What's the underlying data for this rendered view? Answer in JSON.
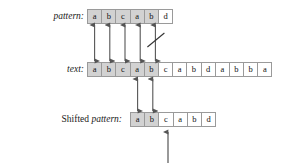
{
  "figure": {
    "background_color": "#ffffff",
    "cell_border_color": "#9a9a9a",
    "cell_shade_color": "#d2d2d2",
    "arrow_color": "#555555",
    "text_color": "#111111"
  },
  "rows": {
    "pattern": {
      "label_roman": "",
      "label_italic": "pattern:",
      "cells": [
        "a",
        "b",
        "c",
        "a",
        "b",
        "d"
      ],
      "shaded": [
        true,
        true,
        true,
        true,
        true,
        false
      ]
    },
    "text": {
      "label_roman": "",
      "label_italic": "text:",
      "cells": [
        "a",
        "b",
        "c",
        "a",
        "b",
        "c",
        "a",
        "b",
        "d",
        "a",
        "b",
        "b",
        "a"
      ],
      "shaded": [
        true,
        true,
        true,
        true,
        true,
        false,
        false,
        false,
        false,
        false,
        false,
        false,
        false
      ]
    },
    "shifted_pattern": {
      "label_roman": "Shifted ",
      "label_italic": "pattern:",
      "cells": [
        "a",
        "b",
        "c",
        "a",
        "b",
        "d"
      ],
      "shaded": [
        true,
        true,
        false,
        false,
        false,
        false
      ]
    }
  },
  "annotations": {
    "match_arrows_top": {
      "count": 5,
      "description": "double-headed vertical arrows linking pattern cells 1-5 to text cells 1-5"
    },
    "mismatch_slash": {
      "on_arrow_index": 5,
      "description": "diagonal slash marking the mismatch at position 5"
    },
    "match_arrows_bottom": {
      "count": 2,
      "description": "double-headed vertical arrows linking text cells 4-5 to shifted pattern cells 1-2"
    },
    "pointer_arrow": {
      "target_cell_index": 3,
      "description": "upward arrow pointing at the third cell of the shifted pattern"
    }
  }
}
